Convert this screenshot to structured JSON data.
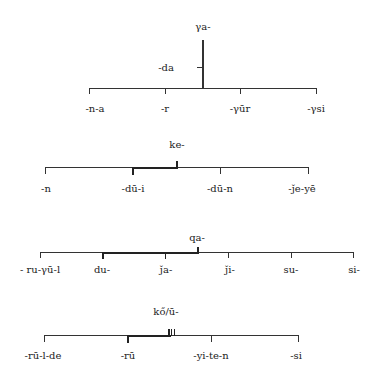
{
  "diagram": {
    "type": "morpheme-position-diagram",
    "groups": [
      {
        "id": "ya",
        "root": "γa-",
        "branch": "-da",
        "ticks": [
          "-n-a",
          "-r",
          "-γūr",
          "-γsi"
        ]
      },
      {
        "id": "ke",
        "root": "ke-",
        "ticks": [
          "-n",
          "-dū-i",
          "-dū-n",
          "-ǰe-yē"
        ]
      },
      {
        "id": "qa",
        "root": "qa-",
        "ticks": [
          "- ru-γū-l",
          "du-",
          "ǰa-",
          "ǰi-",
          "su-",
          "si-"
        ]
      },
      {
        "id": "ko",
        "root": "kő/ū-",
        "ticks": [
          "-rū-l-de",
          "-rū",
          "-yi-te-n",
          "-si"
        ]
      }
    ]
  }
}
